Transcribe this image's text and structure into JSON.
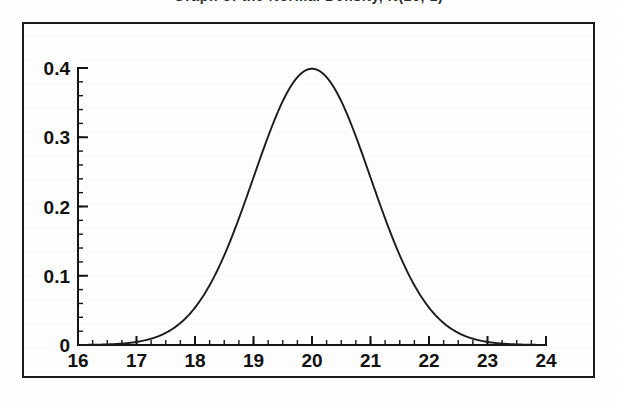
{
  "figure": {
    "title": "Graph of the Normal Density, N(20, 1)",
    "title_visible_note": "cropped at top edge",
    "frame_color": "#1a1a1a",
    "background_color": "#ffffff",
    "curve_color": "#1b1b1b"
  },
  "chart_data": {
    "type": "line",
    "title": "Graph of the Normal Density, N(20, 1)",
    "xlabel": "",
    "ylabel": "",
    "xlim": [
      16,
      24
    ],
    "ylim": [
      0,
      0.4
    ],
    "grid": false,
    "legend": null,
    "distribution": {
      "name": "normal",
      "mean": 20,
      "sigma": 1,
      "peak_value": 0.3989
    },
    "x_major_ticks": [
      16,
      17,
      18,
      19,
      20,
      21,
      22,
      23,
      24
    ],
    "x_tick_labels": [
      "16",
      "17",
      "18",
      "19",
      "20",
      "21",
      "22",
      "23",
      "24"
    ],
    "x_minor_step": 0.25,
    "y_major_ticks": [
      0,
      0.1,
      0.2,
      0.3,
      0.4
    ],
    "y_tick_labels": [
      "0",
      "0.1",
      "0.2",
      "0.3",
      "0.4"
    ],
    "y_minor_step": 0.02,
    "series": [
      {
        "name": "N(20, 1) density",
        "x": [
          16.0,
          16.25,
          16.5,
          16.75,
          17.0,
          17.25,
          17.5,
          17.75,
          18.0,
          18.25,
          18.5,
          18.75,
          19.0,
          19.25,
          19.5,
          19.75,
          20.0,
          20.25,
          20.5,
          20.75,
          21.0,
          21.25,
          21.5,
          21.75,
          22.0,
          22.25,
          22.5,
          22.75,
          23.0,
          23.25,
          23.5,
          23.75,
          24.0
        ],
        "values": [
          0.0001,
          0.0004,
          0.0009,
          0.0022,
          0.0044,
          0.0088,
          0.0175,
          0.0317,
          0.054,
          0.0863,
          0.1295,
          0.1826,
          0.242,
          0.3011,
          0.3521,
          0.3867,
          0.3989,
          0.3867,
          0.3521,
          0.3011,
          0.242,
          0.1826,
          0.1295,
          0.0863,
          0.054,
          0.0317,
          0.0175,
          0.0088,
          0.0044,
          0.0022,
          0.0009,
          0.0004,
          0.0001
        ]
      }
    ]
  }
}
